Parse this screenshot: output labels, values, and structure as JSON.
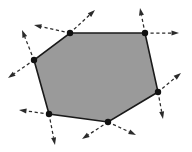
{
  "figure": {
    "caption": "",
    "width": 192,
    "height": 152,
    "background_color": "#ffffff"
  },
  "chart_data": {
    "type": "diagram",
    "xlabel": "",
    "ylabel": "",
    "grid": false,
    "legend": null,
    "shape": {
      "name": "hexagon",
      "sides": 6,
      "fill_color": "#9a9a9a",
      "edge_color": "#1a1a1a",
      "closed": true,
      "vertices": [
        {
          "id": "v1",
          "label": "top-left",
          "x": 70,
          "y": 33
        },
        {
          "id": "v2",
          "label": "top-right",
          "x": 145,
          "y": 33
        },
        {
          "id": "v3",
          "label": "right",
          "x": 158,
          "y": 92
        },
        {
          "id": "v4",
          "label": "bottom-middle",
          "x": 108,
          "y": 122
        },
        {
          "id": "v5",
          "label": "bottom-left",
          "x": 49,
          "y": 114
        },
        {
          "id": "v6",
          "label": "left",
          "x": 34,
          "y": 60
        }
      ]
    },
    "vertex_markers": {
      "style": "filled-circle",
      "color": "#111111",
      "radius": 3.2,
      "count": 6
    },
    "arrows": {
      "style": "dashed",
      "color": "#2b2b2b",
      "head_style": "solid-triangle",
      "count": 12,
      "items": [
        {
          "id": "a1",
          "vertex": "v1",
          "from_x": 70,
          "from_y": 33,
          "to_x": 34,
          "to_y": 25,
          "direction": "left"
        },
        {
          "id": "a2",
          "vertex": "v1",
          "from_x": 70,
          "from_y": 33,
          "to_x": 95,
          "to_y": 10,
          "direction": "up-right"
        },
        {
          "id": "a3",
          "vertex": "v2",
          "from_x": 145,
          "from_y": 33,
          "to_x": 140,
          "to_y": 8,
          "direction": "up"
        },
        {
          "id": "a4",
          "vertex": "v2",
          "from_x": 145,
          "from_y": 33,
          "to_x": 179,
          "to_y": 33,
          "direction": "right"
        },
        {
          "id": "a5",
          "vertex": "v3",
          "from_x": 158,
          "from_y": 92,
          "to_x": 181,
          "to_y": 73,
          "direction": "up-right"
        },
        {
          "id": "a6",
          "vertex": "v3",
          "from_x": 158,
          "from_y": 92,
          "to_x": 163,
          "to_y": 119,
          "direction": "down"
        },
        {
          "id": "a7",
          "vertex": "v4",
          "from_x": 108,
          "from_y": 122,
          "to_x": 136,
          "to_y": 135,
          "direction": "down-right"
        },
        {
          "id": "a8",
          "vertex": "v4",
          "from_x": 108,
          "from_y": 122,
          "to_x": 82,
          "to_y": 139,
          "direction": "down-left"
        },
        {
          "id": "a9",
          "vertex": "v5",
          "from_x": 49,
          "from_y": 114,
          "to_x": 19,
          "to_y": 110,
          "direction": "left"
        },
        {
          "id": "a10",
          "vertex": "v5",
          "from_x": 49,
          "from_y": 114,
          "to_x": 55,
          "to_y": 145,
          "direction": "down"
        },
        {
          "id": "a11",
          "vertex": "v6",
          "from_x": 34,
          "from_y": 60,
          "to_x": 22,
          "to_y": 30,
          "direction": "up-left"
        },
        {
          "id": "a12",
          "vertex": "v6",
          "from_x": 34,
          "from_y": 60,
          "to_x": 8,
          "to_y": 78,
          "direction": "down-left"
        }
      ]
    }
  }
}
